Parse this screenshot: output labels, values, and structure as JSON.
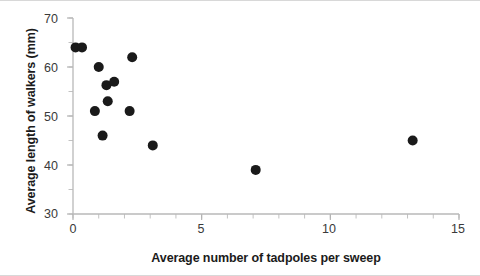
{
  "chart_data": {
    "type": "scatter",
    "title": "",
    "xlabel": "Average number of tadpoles per sweep",
    "ylabel": "Average length of walkers (mm)",
    "xlim": [
      0,
      15
    ],
    "ylim": [
      30,
      70
    ],
    "x_major_ticks": [
      0,
      5,
      10,
      15
    ],
    "x_minor_tick_step": 1,
    "y_major_ticks": [
      30,
      40,
      50,
      60,
      70
    ],
    "y_minor_tick_step": 5,
    "x_tick_labels": [
      "0",
      "5",
      "10",
      "15"
    ],
    "y_tick_labels": [
      "30",
      "40",
      "50",
      "60",
      "70"
    ],
    "grid": false,
    "legend": null,
    "marker": "circle",
    "marker_color": "#1a1a1a",
    "marker_size": 5,
    "points": [
      {
        "x": 0.1,
        "y": 64.0
      },
      {
        "x": 0.35,
        "y": 64.0
      },
      {
        "x": 1.0,
        "y": 60.0
      },
      {
        "x": 2.3,
        "y": 62.0
      },
      {
        "x": 1.3,
        "y": 56.3
      },
      {
        "x": 1.6,
        "y": 57.0
      },
      {
        "x": 1.35,
        "y": 53.0
      },
      {
        "x": 0.85,
        "y": 51.0
      },
      {
        "x": 2.2,
        "y": 51.0
      },
      {
        "x": 1.15,
        "y": 46.0
      },
      {
        "x": 3.1,
        "y": 44.0
      },
      {
        "x": 7.1,
        "y": 39.0
      },
      {
        "x": 13.2,
        "y": 45.0
      }
    ]
  },
  "axes": {
    "x_title": "Average number of tadpoles per sweep",
    "y_title": "Average length of walkers (mm)",
    "y_labels": [
      "70",
      "60",
      "50",
      "40",
      "30"
    ],
    "x_labels": [
      "0",
      "5",
      "10",
      "15"
    ]
  }
}
